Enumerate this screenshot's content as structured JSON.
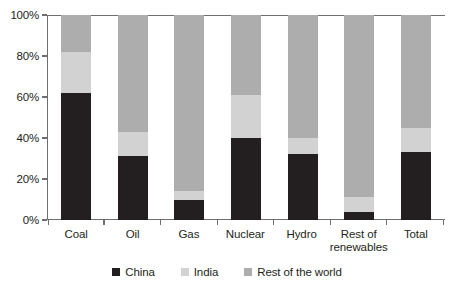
{
  "chart_data": {
    "type": "bar",
    "subtype": "stacked-100-percent",
    "title": "",
    "xlabel": "",
    "ylabel": "",
    "ylim": [
      0,
      100
    ],
    "ytick_labels": [
      "100%",
      "80%",
      "60%",
      "40%",
      "20%",
      "0%"
    ],
    "ytick_values": [
      100,
      80,
      60,
      40,
      20,
      0
    ],
    "grid": false,
    "legend_position": "bottom-center",
    "categories": [
      "Coal",
      "Oil",
      "Gas",
      "Nuclear",
      "Hydro",
      "Rest of\nrenewables",
      "Total"
    ],
    "series": [
      {
        "name": "China",
        "color": "#231f20",
        "values": [
          62,
          31,
          10,
          40,
          32,
          4,
          33
        ]
      },
      {
        "name": "India",
        "color": "#d2d2d2",
        "values": [
          20,
          12,
          4,
          21,
          8,
          7,
          12
        ]
      },
      {
        "name": "Rest of the world",
        "color": "#adadad",
        "values": [
          18,
          57,
          86,
          39,
          60,
          89,
          55
        ]
      }
    ]
  },
  "axis": {
    "y_ticks": [
      {
        "label": "100%"
      },
      {
        "label": "80%"
      },
      {
        "label": "60%"
      },
      {
        "label": "40%"
      },
      {
        "label": "20%"
      },
      {
        "label": "0%"
      }
    ],
    "x_labels": [
      {
        "label": "Coal"
      },
      {
        "label": "Oil"
      },
      {
        "label": "Gas"
      },
      {
        "label": "Nuclear"
      },
      {
        "label": "Hydro"
      },
      {
        "label": "Rest of\nrenewables"
      },
      {
        "label": "Total"
      }
    ]
  },
  "legend": {
    "items": [
      {
        "label": "China",
        "color": "#231f20"
      },
      {
        "label": "India",
        "color": "#d2d2d2"
      },
      {
        "label": "Rest of the world",
        "color": "#adadad"
      }
    ]
  },
  "colors": {
    "china": "#231f20",
    "india": "#d2d2d2",
    "rest_of_world": "#adadad",
    "axis": "#6d6e71",
    "text": "#231f20",
    "background": "#ffffff"
  }
}
